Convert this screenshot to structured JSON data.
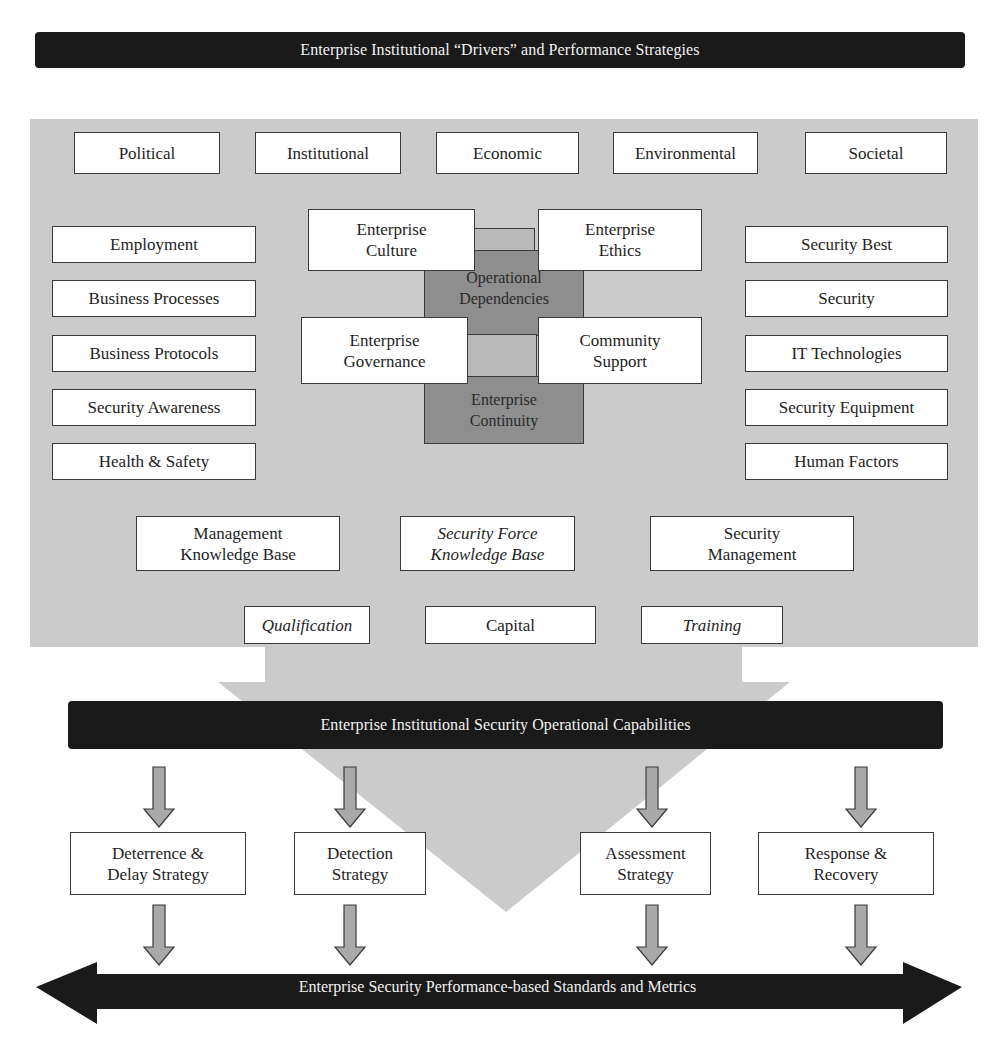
{
  "header": {
    "title": "Enterprise Institutional “Drivers” and Performance Strategies"
  },
  "drivers": {
    "top_row": [
      {
        "label": "Political"
      },
      {
        "label": "Institutional"
      },
      {
        "label": "Economic"
      },
      {
        "label": "Environmental"
      },
      {
        "label": "Societal"
      }
    ],
    "left_column": [
      {
        "label": "Employment"
      },
      {
        "label": "Business Processes"
      },
      {
        "label": "Business Protocols"
      },
      {
        "label": "Security Awareness"
      },
      {
        "label": "Health & Safety"
      }
    ],
    "right_column": [
      {
        "label": "Security Best"
      },
      {
        "label": "Security"
      },
      {
        "label": "IT Technologies"
      },
      {
        "label": "Security Equipment"
      },
      {
        "label": "Human Factors"
      }
    ],
    "center": {
      "culture": "Enterprise\nCulture",
      "ethics": "Enterprise\nEthics",
      "governance": "Enterprise\nGovernance",
      "community": "Community\nSupport",
      "dependencies": "Operational\nDependencies",
      "continuity": "Enterprise\nContinuity"
    },
    "knowledge_row": [
      {
        "label": "Management\nKnowledge Base",
        "italic": false
      },
      {
        "label": "Security Force\nKnowledge Base",
        "italic": true
      },
      {
        "label": "Security\nManagement",
        "italic": false
      }
    ],
    "resources_row": [
      {
        "label": "Qualification",
        "italic": true
      },
      {
        "label": "Capital",
        "italic": false
      },
      {
        "label": "Training",
        "italic": true
      }
    ]
  },
  "capabilities": {
    "title": "Enterprise Institutional Security Operational Capabilities"
  },
  "strategies": [
    {
      "label": "Deterrence &\nDelay Strategy"
    },
    {
      "label": "Detection\nStrategy"
    },
    {
      "label": "Assessment\nStrategy"
    },
    {
      "label": "Response &\nRecovery"
    }
  ],
  "metrics": {
    "title": "Enterprise Security Performance-based Standards and Metrics"
  },
  "colors": {
    "dark_bar": "#1a1a1a",
    "panel_gray": "#cbcbcb",
    "dependency_gray": "#8e8e8e",
    "arrow_gray": "#a9a9a9",
    "box_border": "#3a3a3a"
  }
}
